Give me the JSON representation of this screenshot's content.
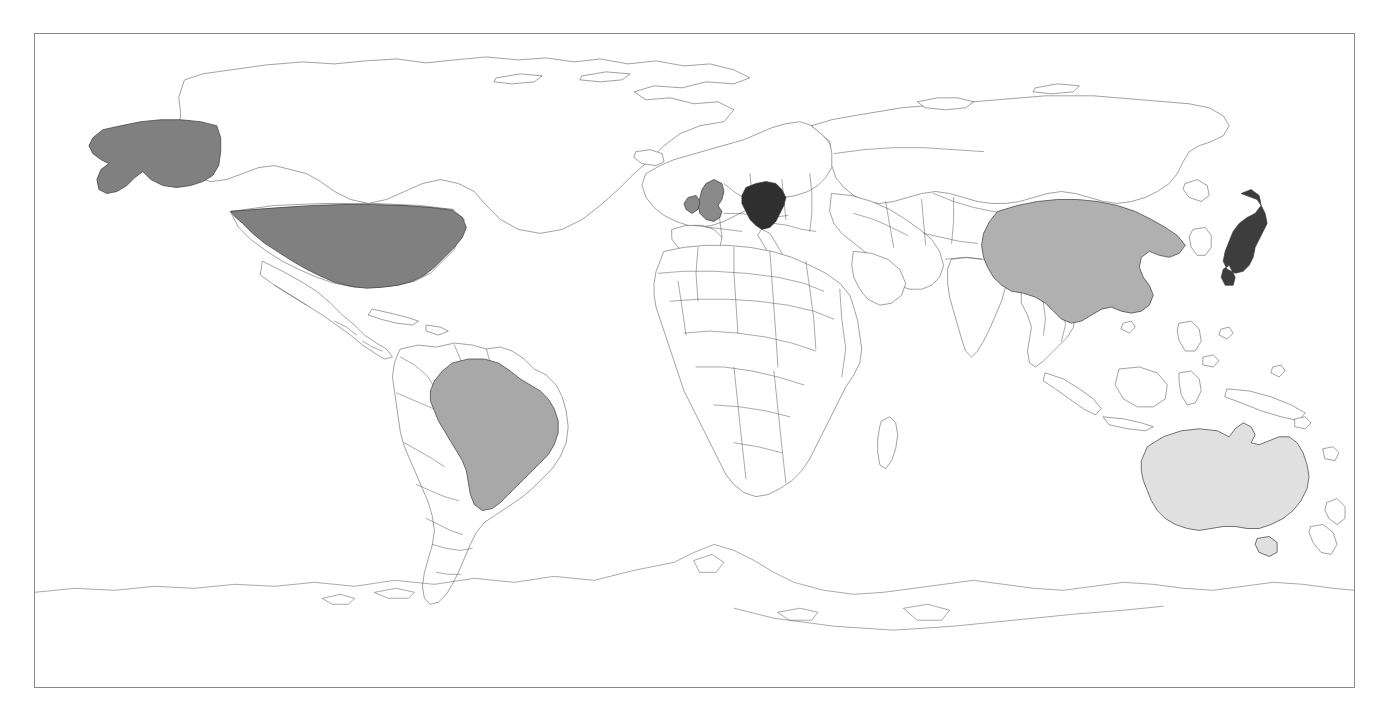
{
  "map": {
    "title": "World Map",
    "projection": "equirectangular",
    "frame": {
      "border_color": "#8a8a8a",
      "background_color": "#ffffff",
      "x": 34,
      "y": 33,
      "width": 1321,
      "height": 655
    },
    "base": {
      "land_fill": "#ffffff",
      "coastline_color": "#555555",
      "country_border_color": "#555555"
    },
    "shading_scale": {
      "description": "Countries shaded in four gray levels from darkest to lightest",
      "levels": [
        {
          "name": "darkest",
          "color": "#3a3a3a"
        },
        {
          "name": "dark",
          "color": "#808080"
        },
        {
          "name": "medium",
          "color": "#ababab"
        },
        {
          "name": "lightest",
          "color": "#e0e0e0"
        }
      ]
    },
    "highlighted_countries": [
      {
        "name": "Germany",
        "level": "darkest",
        "color": "#2f2f2f"
      },
      {
        "name": "Japan",
        "level": "darkest",
        "color": "#3d3d3d"
      },
      {
        "name": "United States",
        "level": "dark",
        "color": "#808080"
      },
      {
        "name": "Alaska",
        "level": "dark",
        "color": "#808080"
      },
      {
        "name": "United Kingdom",
        "level": "dark",
        "color": "#8a8a8a"
      },
      {
        "name": "China",
        "level": "medium",
        "color": "#b0b0b0"
      },
      {
        "name": "Brazil",
        "level": "medium",
        "color": "#a8a8a8"
      },
      {
        "name": "Australia",
        "level": "lightest",
        "color": "#e0e0e0"
      }
    ],
    "unshaded_regions": [
      "Canada",
      "Greenland",
      "Mexico",
      "Russia",
      "India",
      "Africa",
      "Europe (other)",
      "Southeast Asia",
      "Antarctica",
      "New Zealand",
      "Argentina",
      "Chile",
      "Saudi Arabia",
      "Indonesia"
    ]
  }
}
